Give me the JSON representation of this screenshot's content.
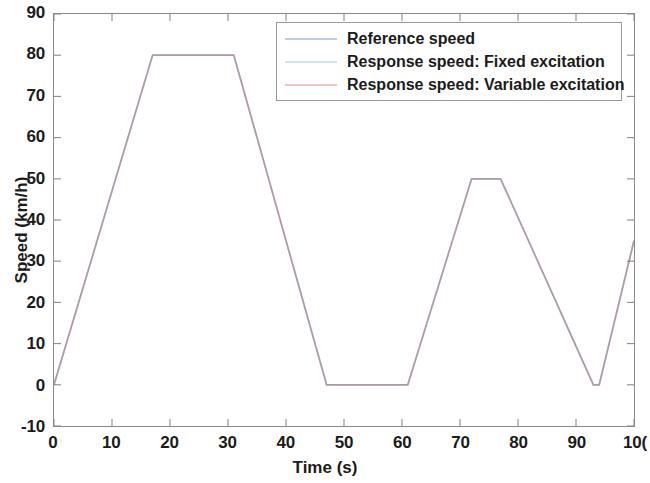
{
  "chart_data": {
    "type": "line",
    "title": "",
    "xlabel": "Time (s)",
    "ylabel": "Speed (km/h)",
    "xlim": [
      0,
      100
    ],
    "ylim": [
      -10,
      90
    ],
    "xticks": [
      0,
      10,
      20,
      30,
      40,
      50,
      60,
      70,
      80,
      90,
      100
    ],
    "xtick_labels": [
      "0",
      "10",
      "20",
      "30",
      "40",
      "50",
      "60",
      "70",
      "80",
      "90",
      "10("
    ],
    "yticks": [
      -10,
      0,
      10,
      20,
      30,
      40,
      50,
      60,
      70,
      80,
      90
    ],
    "ytick_labels": [
      "-10",
      "0",
      "10",
      "20",
      "30",
      "40",
      "50",
      "60",
      "70",
      "80",
      "90"
    ],
    "grid": false,
    "legend_position": "top-right-inside",
    "series": [
      {
        "name": "Reference speed",
        "color": "#3b4cc0",
        "x": [
          0,
          17,
          31,
          47,
          61,
          72,
          77,
          93,
          94,
          100
        ],
        "y": [
          0,
          80,
          80,
          0,
          0,
          50,
          50,
          0,
          0,
          35
        ]
      },
      {
        "name": "Response speed: Fixed excitation",
        "color": "#2fa8a8",
        "x": [
          0,
          17,
          31,
          47,
          61,
          72,
          77,
          93,
          94,
          100
        ],
        "y": [
          0,
          80,
          80,
          0,
          0,
          50,
          50,
          0,
          0,
          35
        ]
      },
      {
        "name": "Response speed: Variable excitation",
        "color": "#d4534a",
        "x": [
          0,
          17,
          31,
          47,
          61,
          72,
          77,
          93,
          94,
          100
        ],
        "y": [
          0,
          80,
          80,
          0,
          0,
          50,
          50,
          0,
          0,
          35
        ]
      }
    ]
  },
  "axes": {
    "frame_color": "#8a8a8a"
  }
}
